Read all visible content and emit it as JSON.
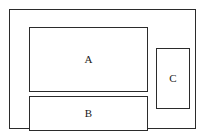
{
  "diagram": {
    "type": "block-layout",
    "canvas": {
      "width": 206,
      "height": 138,
      "background_color": "#ffffff"
    },
    "stroke_color": "#2b2b2b",
    "fill_color": "#ffffff",
    "label_color": "#1a1a1a",
    "container": {
      "name": "outer-frame",
      "label": "",
      "x": 9,
      "y": 9,
      "width": 187,
      "height": 120
    },
    "blocks": [
      {
        "id": "a",
        "label": "A",
        "x": 19,
        "y": 17,
        "width": 119,
        "height": 65
      },
      {
        "id": "b",
        "label": "B",
        "x": 19,
        "y": 86,
        "width": 119,
        "height": 35
      },
      {
        "id": "c",
        "label": "C",
        "x": 146,
        "y": 38,
        "width": 34,
        "height": 61
      }
    ]
  }
}
